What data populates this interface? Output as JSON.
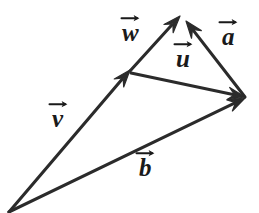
{
  "figure": {
    "background_color": "#ffffff",
    "stroke_color": "#2b2b2b",
    "label_color": "#1a1a1a",
    "width": 259,
    "height": 213
  },
  "vectors": [
    {
      "id": "v",
      "label": "v",
      "from": [
        9,
        212
      ],
      "to": [
        130,
        70
      ],
      "arrowhead": "to",
      "label_pos": [
        52,
        106
      ],
      "label_size": 25
    },
    {
      "id": "w",
      "label": "w",
      "from": [
        130,
        71
      ],
      "to": [
        180,
        16
      ],
      "arrowhead": "to",
      "label_pos": [
        122,
        20
      ],
      "label_size": 25
    },
    {
      "id": "a",
      "label": "a",
      "from": [
        245,
        97
      ],
      "to": [
        186,
        21
      ],
      "arrowhead": "to",
      "label_pos": [
        222,
        24
      ],
      "label_size": 25
    },
    {
      "id": "u",
      "label": "u",
      "from": [
        131,
        73
      ],
      "to": [
        245,
        97
      ],
      "arrowhead": "to",
      "label_pos": [
        176,
        46
      ],
      "label_size": 25
    },
    {
      "id": "b",
      "label": "b",
      "from": [
        9,
        212
      ],
      "to": [
        245,
        98
      ],
      "arrowhead": "to",
      "label_pos": [
        139,
        155
      ],
      "label_size": 25
    }
  ]
}
